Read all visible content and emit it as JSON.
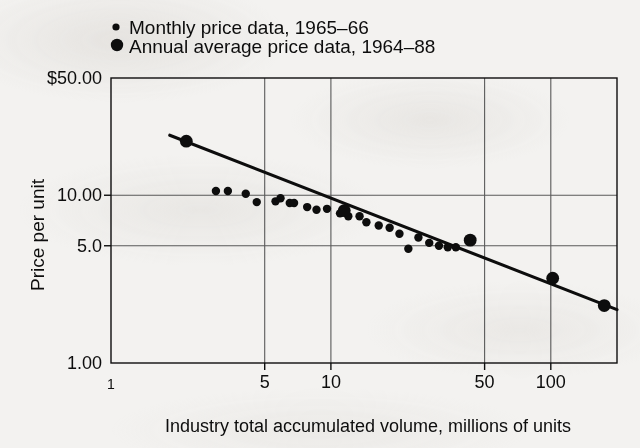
{
  "figure": {
    "background_color": "#f3f2f0",
    "ink_color": "#0d0d0d",
    "grid_color": "#5a5a5a"
  },
  "legend": {
    "position": "top-left",
    "entries": [
      {
        "label": "Monthly price data, 1965–66",
        "marker": "small-dot",
        "radius": 3.6
      },
      {
        "label": "Annual average price data, 1964–88",
        "marker": "large-dot",
        "radius": 6.2
      }
    ]
  },
  "chart_data": {
    "type": "scatter",
    "title": "",
    "subtitle": "",
    "xlabel": "Industry total accumulated volume, millions of units",
    "ylabel": "Price per unit",
    "xscale": "log",
    "yscale": "log",
    "xlim": [
      1,
      200
    ],
    "ylim": [
      1.0,
      50.0
    ],
    "xticks": [
      1,
      5,
      10,
      50,
      100
    ],
    "xticklabels": [
      "1",
      "5",
      "10",
      "50",
      "100"
    ],
    "yticks": [
      1.0,
      5.0,
      10.0,
      50.0
    ],
    "yticklabels": [
      "1.00",
      "5.0",
      "10.00",
      "$50.00"
    ],
    "grid": true,
    "grid_axes": "both",
    "legend_position": "above-plot-left",
    "series": [
      {
        "name": "Annual average price data, 1964–88",
        "marker": "large-dot",
        "points": [
          {
            "x": 2.2,
            "y": 21.0
          },
          {
            "x": 11.5,
            "y": 8.1
          },
          {
            "x": 43.0,
            "y": 5.4
          },
          {
            "x": 102.0,
            "y": 3.2
          },
          {
            "x": 175.0,
            "y": 2.2
          }
        ]
      },
      {
        "name": "Monthly price data, 1965–66",
        "marker": "small-dot",
        "points": [
          {
            "x": 3.0,
            "y": 10.6
          },
          {
            "x": 3.4,
            "y": 10.6
          },
          {
            "x": 4.1,
            "y": 10.2
          },
          {
            "x": 4.6,
            "y": 9.1
          },
          {
            "x": 5.6,
            "y": 9.2
          },
          {
            "x": 5.9,
            "y": 9.6
          },
          {
            "x": 6.5,
            "y": 9.0
          },
          {
            "x": 6.8,
            "y": 9.0
          },
          {
            "x": 7.8,
            "y": 8.5
          },
          {
            "x": 8.6,
            "y": 8.2
          },
          {
            "x": 9.6,
            "y": 8.3
          },
          {
            "x": 11.0,
            "y": 7.8
          },
          {
            "x": 12.0,
            "y": 7.5
          },
          {
            "x": 13.5,
            "y": 7.5
          },
          {
            "x": 14.5,
            "y": 6.9
          },
          {
            "x": 16.5,
            "y": 6.6
          },
          {
            "x": 18.5,
            "y": 6.4
          },
          {
            "x": 20.5,
            "y": 5.9
          },
          {
            "x": 22.5,
            "y": 4.8
          },
          {
            "x": 25.0,
            "y": 5.6
          },
          {
            "x": 28.0,
            "y": 5.2
          },
          {
            "x": 31.0,
            "y": 5.0
          },
          {
            "x": 34.0,
            "y": 4.9
          },
          {
            "x": 37.0,
            "y": 4.9
          }
        ]
      }
    ],
    "fit_line": {
      "name": "experience-curve-fit",
      "x_start": 1.85,
      "y_start": 22.8,
      "x_end": 200.0,
      "y_end": 2.08,
      "description": "log-log linear experience curve"
    },
    "annotations": []
  }
}
